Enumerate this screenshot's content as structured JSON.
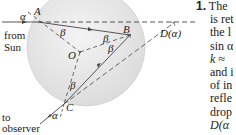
{
  "figure": {
    "labels": {
      "alpha_in": "α",
      "A": "A",
      "B": "B",
      "O": "O",
      "C": "C",
      "beta_A": "β",
      "beta_B1": "β",
      "beta_B2": "β",
      "beta_C": "β",
      "alpha_out": "α",
      "D": "D(α)",
      "from": "from",
      "sun": "Sun",
      "to": "to",
      "observer": "observer"
    }
  },
  "text_column": {
    "lines": [
      "The",
      "is ret",
      "the l",
      "sin α",
      "k ≈",
      "and i",
      "of in",
      "refle",
      "drop",
      "D(α"
    ],
    "number": "1."
  }
}
